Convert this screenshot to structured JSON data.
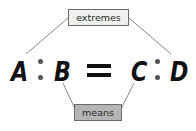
{
  "diagram": {
    "proportion": {
      "terms": [
        "A",
        "B",
        "C",
        "D"
      ],
      "ratio_separator": ":",
      "equals_sign": "="
    },
    "labels": {
      "extremes": "extremes",
      "means": "means"
    },
    "connections": [
      {
        "label": "extremes",
        "terms": [
          "A",
          "D"
        ]
      },
      {
        "label": "means",
        "terms": [
          "B",
          "C"
        ]
      }
    ],
    "colors": {
      "extremes_box_fill": "#f0f0f0",
      "means_box_fill": "#b5b5b5",
      "line_color": "#6a6a6a",
      "text_color": "#111111"
    }
  }
}
